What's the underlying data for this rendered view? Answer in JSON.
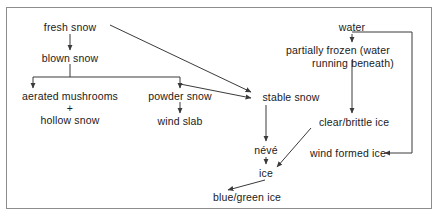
{
  "diagram": {
    "title_present": false,
    "type": "flow-diagram",
    "theme": {
      "background": "#ffffff",
      "border": "#8d8d8d",
      "text": "#1a1a1a",
      "edge": "#3a3a3a"
    },
    "nodes": [
      {
        "id": "fresh-snow",
        "label": "fresh snow"
      },
      {
        "id": "blown-snow",
        "label": "blown snow"
      },
      {
        "id": "aerated-mushrooms",
        "label": "aerated mushrooms"
      },
      {
        "id": "plus",
        "label": "+"
      },
      {
        "id": "hollow-snow",
        "label": "hollow snow"
      },
      {
        "id": "powder-snow",
        "label": "powder snow"
      },
      {
        "id": "wind-slab",
        "label": "wind slab"
      },
      {
        "id": "stable-snow",
        "label": "stable snow"
      },
      {
        "id": "water",
        "label": "water"
      },
      {
        "id": "partially-frozen-1",
        "label": "partially frozen (water"
      },
      {
        "id": "partially-frozen-2",
        "label": "running beneath)"
      },
      {
        "id": "clear-brittle-ice",
        "label": "clear/brittle ice"
      },
      {
        "id": "wind-formed-ice",
        "label": "wind formed ice"
      },
      {
        "id": "neve",
        "label": "névé"
      },
      {
        "id": "ice",
        "label": "ice"
      },
      {
        "id": "blue-green-ice",
        "label": "blue/green ice"
      }
    ],
    "edges": [
      {
        "from": "fresh-snow",
        "to": "blown-snow",
        "style": "straight-down"
      },
      {
        "from": "fresh-snow",
        "to": "stable-snow",
        "style": "diagonal"
      },
      {
        "from": "blown-snow",
        "to": "aerated-mushrooms",
        "style": "split-bar"
      },
      {
        "from": "blown-snow",
        "to": "powder-snow",
        "style": "split-bar"
      },
      {
        "from": "blown-snow",
        "to": "stable-snow",
        "style": "diagonal"
      },
      {
        "from": "powder-snow",
        "to": "wind-slab",
        "style": "straight-down"
      },
      {
        "from": "water",
        "to": "partially-frozen-1",
        "style": "straight-down"
      },
      {
        "from": "water",
        "to": "wind-formed-ice",
        "style": "elbow-right"
      },
      {
        "from": "partially-frozen-2",
        "to": "clear-brittle-ice",
        "style": "straight-down"
      },
      {
        "from": "stable-snow",
        "to": "neve",
        "style": "straight-down"
      },
      {
        "from": "neve",
        "to": "ice",
        "style": "straight-down"
      },
      {
        "from": "clear-brittle-ice",
        "to": "ice",
        "style": "diagonal"
      },
      {
        "from": "ice",
        "to": "blue-green-ice",
        "style": "diagonal"
      }
    ]
  }
}
